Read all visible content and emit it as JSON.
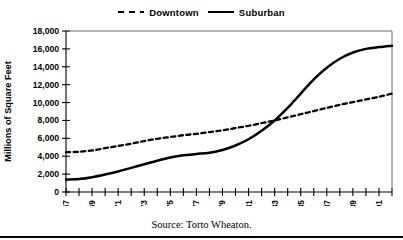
{
  "chart_data": {
    "type": "line",
    "title": "",
    "xlabel": "",
    "ylabel": "Millions of Square Feet",
    "ylim": [
      0,
      18000
    ],
    "xlim": [
      1967,
      1992
    ],
    "ytick_step": 2000,
    "yticks": [
      "0",
      "2,000",
      "4,000",
      "6,000",
      "8,000",
      "10,000",
      "12,000",
      "14,000",
      "16,000",
      "18,000"
    ],
    "ytick_values": [
      0,
      2000,
      4000,
      6000,
      8000,
      10000,
      12000,
      14000,
      16000,
      18000
    ],
    "grid": false,
    "legend_position": "top-center",
    "x": [
      1967,
      1968,
      1969,
      1970,
      1971,
      1972,
      1973,
      1974,
      1975,
      1976,
      1977,
      1978,
      1979,
      1980,
      1981,
      1982,
      1983,
      1984,
      1985,
      1986,
      1987,
      1988,
      1989,
      1990,
      1991,
      1992
    ],
    "xticks_all": [
      1967,
      1968,
      1969,
      1970,
      1971,
      1972,
      1973,
      1974,
      1975,
      1976,
      1977,
      1978,
      1979,
      1980,
      1981,
      1982,
      1983,
      1984,
      1985,
      1986,
      1987,
      1988,
      1989,
      1990,
      1991,
      1992
    ],
    "xtick_labels": [
      "1967",
      "1969",
      "1971",
      "1973",
      "1975",
      "1977",
      "1979",
      "1981",
      "1983",
      "1985",
      "1987",
      "1989",
      "1991"
    ],
    "xtick_label_values": [
      1967,
      1969,
      1971,
      1973,
      1975,
      1977,
      1979,
      1981,
      1983,
      1985,
      1987,
      1989,
      1991
    ],
    "series": [
      {
        "name": "Downtown",
        "style": "dashed",
        "color": "#000000",
        "values": [
          4450,
          4500,
          4650,
          4900,
          5150,
          5400,
          5700,
          5950,
          6150,
          6350,
          6500,
          6700,
          6900,
          7150,
          7400,
          7700,
          8000,
          8350,
          8700,
          9050,
          9400,
          9750,
          10050,
          10350,
          10650,
          11000
        ]
      },
      {
        "name": "Suburban",
        "style": "solid",
        "color": "#000000",
        "values": [
          1400,
          1450,
          1650,
          1950,
          2300,
          2700,
          3100,
          3500,
          3850,
          4100,
          4250,
          4400,
          4700,
          5200,
          5900,
          6850,
          8000,
          9400,
          11000,
          12600,
          13900,
          14900,
          15600,
          16000,
          16200,
          16350
        ]
      }
    ],
    "source_note": "Source: Torto Wheaton."
  },
  "legend": {
    "entries": [
      {
        "label": "Downtown",
        "icon": "dashed-line-swatch"
      },
      {
        "label": "Suburban",
        "icon": "solid-line-swatch"
      }
    ]
  },
  "footer": {
    "source": "Source: Torto Wheaton."
  }
}
